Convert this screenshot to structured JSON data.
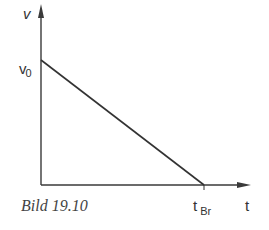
{
  "diagram": {
    "y_axis_label": "v",
    "x_axis_label": "t",
    "y_intercept_label": "v",
    "y_intercept_sub": "0",
    "x_intercept_label": "t",
    "x_intercept_sub": "Br",
    "caption": "Bild 19.10",
    "line_color": "#333333"
  }
}
